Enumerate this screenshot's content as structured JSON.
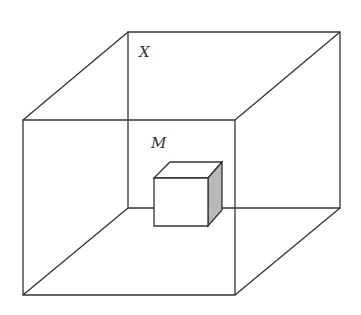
{
  "labels": {
    "x": "X",
    "m": "M"
  },
  "colors": {
    "line": "#333333",
    "shade": "#b8b8b8",
    "background": "#ffffff"
  }
}
